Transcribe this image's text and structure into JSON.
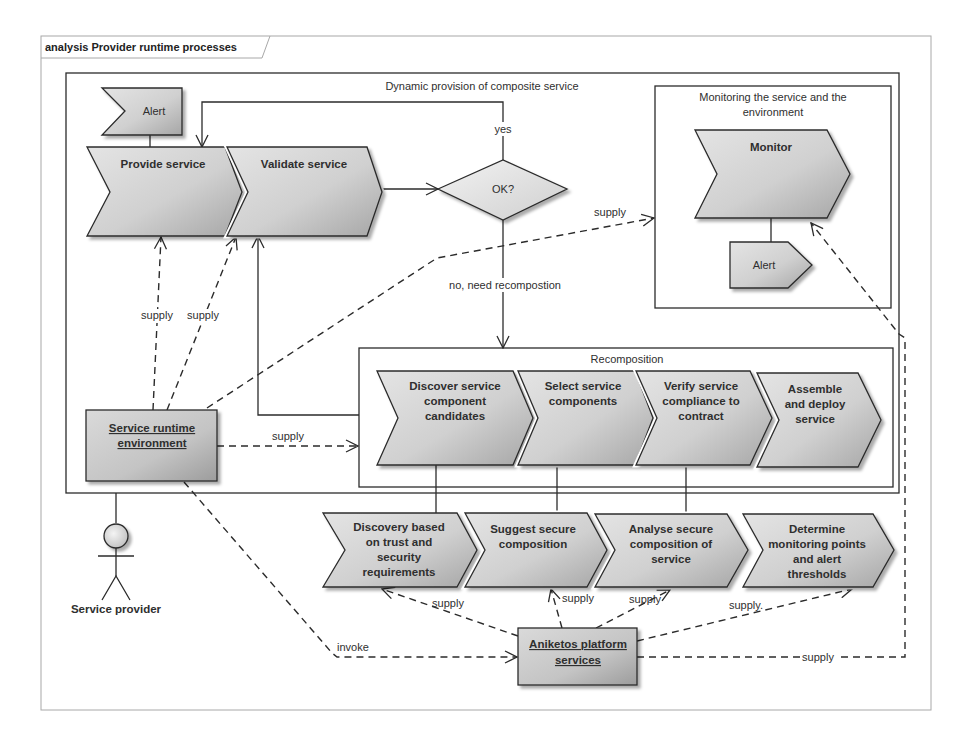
{
  "frame": {
    "title": "analysis Provider runtime processes"
  },
  "dynamic_provision": {
    "title": "Dynamic provision of composite service"
  },
  "nodes": {
    "alert_top": "Alert",
    "provide_service": "Provide service",
    "validate_service": "Validate service",
    "decision": "OK?",
    "monitoring_group": {
      "lines": [
        "Monitoring the service and the",
        "environment"
      ]
    },
    "monitor": "Monitor",
    "alert_monitor": "Alert",
    "service_runtime_environment": {
      "lines": [
        "Service runtime",
        "environment"
      ]
    },
    "recomposition_group": "Recomposition",
    "recomposition_steps": [
      {
        "lines": [
          "Discover service",
          "component",
          "candidates"
        ]
      },
      {
        "lines": [
          "Select service",
          "components"
        ]
      },
      {
        "lines": [
          "Verify service",
          "compliance to",
          "contract"
        ]
      },
      {
        "lines": [
          "Assemble",
          "and deploy",
          "service"
        ]
      }
    ],
    "platform_steps": [
      {
        "lines": [
          "Discovery based",
          "on trust and",
          "security",
          "requirements"
        ]
      },
      {
        "lines": [
          "Suggest secure",
          "composition"
        ]
      },
      {
        "lines": [
          "Analyse secure",
          "composition of",
          "service"
        ]
      },
      {
        "lines": [
          "Determine",
          "monitoring points",
          "and alert",
          "thresholds"
        ]
      }
    ],
    "aniketos_platform": {
      "lines": [
        "Aniketos platform",
        "services"
      ]
    },
    "actor": "Service provider"
  },
  "edge_labels": {
    "yes": "yes",
    "no": "no, need recompostion",
    "supply_provide": "supply",
    "supply_validate": "supply",
    "supply_monitor_top": "supply",
    "supply_recomposition": "supply",
    "supply_discovery": "supply",
    "supply_suggest": "supply",
    "supply_analyse": "supply",
    "supply_determine": "supply.",
    "supply_monitor_bottom": "supply",
    "invoke": "invoke"
  },
  "colors": {
    "stroke": "#2b2b2b",
    "shape_fill_light": "#e2e2e2",
    "shape_fill_dark": "#a5a5a5",
    "frame_border": "#a8a8a8",
    "background": "#ffffff"
  }
}
